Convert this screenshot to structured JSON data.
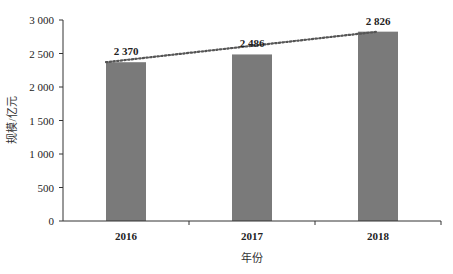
{
  "chart_data": {
    "type": "bar",
    "title": "",
    "xlabel": "年份",
    "ylabel": "规模/亿元",
    "categories": [
      "2016",
      "2017",
      "2018"
    ],
    "values": [
      2370,
      2486,
      2826
    ],
    "value_labels": [
      "2 370",
      "2 486",
      "2 826"
    ],
    "ylim": [
      0,
      3000
    ],
    "yticks": [
      0,
      500,
      1000,
      1500,
      2000,
      2500,
      3000
    ],
    "ytick_labels": [
      "0",
      "500",
      "1 000",
      "1 500",
      "2 000",
      "2 500",
      "3 000"
    ],
    "grid": false,
    "legend": null,
    "trendline": {
      "style": "dotted",
      "from": "2016",
      "to": "2018"
    },
    "bar_color": "#7a7a7a",
    "trendline_color": "#555555"
  }
}
